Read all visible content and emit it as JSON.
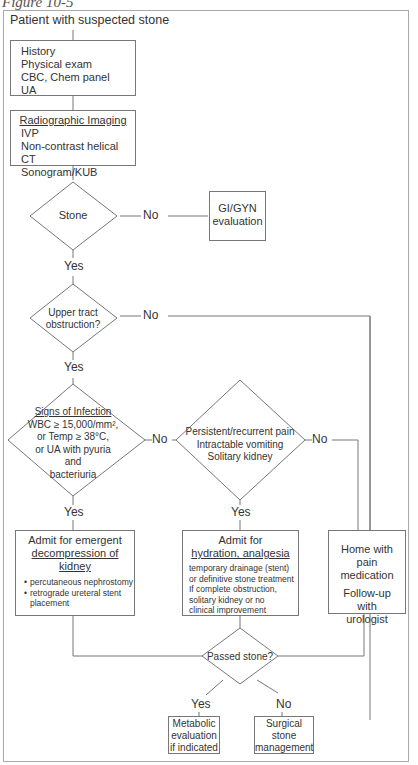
{
  "figure": {
    "title": "Figure 10-5"
  },
  "start": {
    "label": "Patient with suspected stone"
  },
  "initial_workup": {
    "lines": [
      "History",
      "Physical exam",
      "CBC, Chem panel",
      "UA"
    ]
  },
  "imaging": {
    "title": "Radiographic Imaging",
    "lines": [
      "IVP",
      "Non-contrast helical CT",
      "Sonogram/KUB"
    ]
  },
  "decision_stone": {
    "label": "Stone",
    "no_label": "No",
    "yes_label": "Yes"
  },
  "gi_gyn": {
    "lines": [
      "GI/GYN",
      "evaluation"
    ]
  },
  "decision_obstruction": {
    "lines": [
      "Upper tract",
      "obstruction?"
    ],
    "no_label": "No",
    "yes_label": "Yes"
  },
  "decision_infection": {
    "title": "Signs of Infection",
    "lines": [
      "WBC ≥ 15,000/mm²,",
      "or Temp ≥ 38°C,",
      "or UA with pyuria",
      "and",
      "bacteriuria"
    ],
    "no_label": "No",
    "yes_label": "Yes"
  },
  "decision_pain": {
    "lines": [
      "Persistent/recurrent pain",
      "Intractable vomiting",
      "Solitary kidney"
    ],
    "no_label": "No",
    "yes_label": "Yes"
  },
  "admit_emergent": {
    "title_lines": [
      "Admit for emergent",
      "decompression of kidney"
    ],
    "bullets": [
      "percutaneous nephrostomy",
      "retrograde ureteral stent placement"
    ]
  },
  "admit_hydration": {
    "title_lines": [
      "Admit for",
      "hydration, analgesia"
    ],
    "lines": [
      "temporary drainage (stent)",
      "or definitive stone treatment",
      "If complete obstruction,",
      "solitary kidney or no",
      "clinical improvement"
    ]
  },
  "home": {
    "lines": [
      "Home with",
      "pain medication"
    ],
    "followup": [
      "Follow-up",
      "with",
      "urologist"
    ]
  },
  "decision_passed": {
    "label": "Passed stone?",
    "yes_label": "Yes",
    "no_label": "No"
  },
  "metabolic": {
    "lines": [
      "Metabolic",
      "evaluation",
      "if indicated"
    ]
  },
  "surgical": {
    "lines": [
      "Surgical",
      "stone",
      "management"
    ]
  }
}
